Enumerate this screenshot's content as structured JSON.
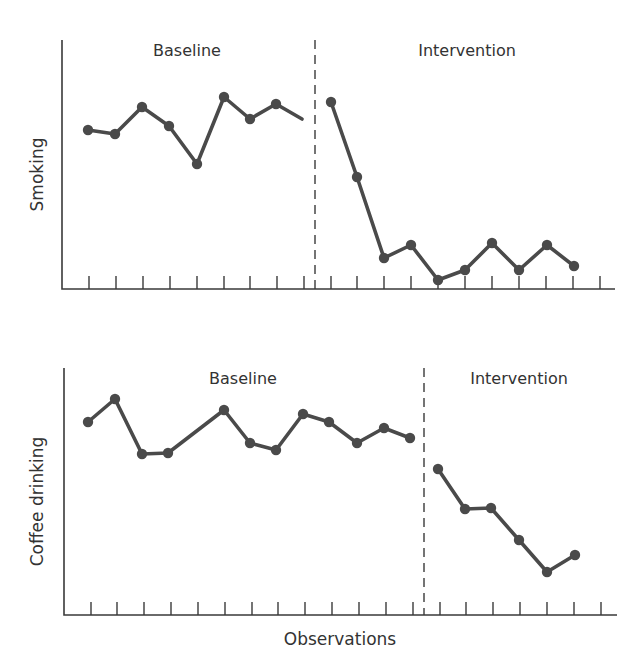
{
  "chart_data": [
    {
      "type": "line",
      "title": "",
      "ylabel": "Smoking",
      "xlabel": "",
      "grid": false,
      "phases": [
        {
          "label": "Baseline",
          "start_obs": 1,
          "end_obs": 9
        },
        {
          "label": "Intervention",
          "start_obs": 10,
          "end_obs": 19
        }
      ],
      "phase_change_after_obs": 9,
      "observations": 20,
      "y_units": "relative (0 = axis, 100 = top)",
      "series": [
        {
          "name": "Baseline",
          "x": [
            1,
            2,
            3,
            4,
            5,
            6,
            7,
            8,
            9
          ],
          "values": [
            63,
            62,
            73,
            65,
            51,
            77,
            68,
            74,
            68
          ],
          "last_point_marker": false
        },
        {
          "name": "Intervention",
          "x": [
            10,
            11,
            12,
            13,
            14,
            15,
            16,
            17,
            18,
            19
          ],
          "values": [
            75,
            45,
            13,
            18,
            4,
            8,
            19,
            8,
            18,
            10
          ]
        }
      ]
    },
    {
      "type": "line",
      "title": "",
      "ylabel": "Coffee drinking",
      "xlabel": "Observations",
      "grid": false,
      "phases": [
        {
          "label": "Baseline",
          "start_obs": 1,
          "end_obs": 13
        },
        {
          "label": "Intervention",
          "start_obs": 14,
          "end_obs": 19
        }
      ],
      "phase_change_after_obs": 13,
      "observations": 20,
      "y_units": "relative (0 = axis, 100 = top)",
      "series": [
        {
          "name": "Baseline",
          "x": [
            1,
            2,
            4,
            5,
            7,
            8,
            9,
            10,
            11,
            12,
            13,
            14
          ],
          "values": [
            78,
            88,
            65,
            66,
            84,
            70,
            67,
            82,
            78,
            70,
            76,
            72
          ]
        },
        {
          "name": "Intervention",
          "x": [
            15,
            16,
            17,
            18,
            19,
            20
          ],
          "values": [
            59,
            43,
            43,
            30,
            17,
            24
          ]
        }
      ]
    }
  ],
  "panels": [
    {
      "ylabel": "Smoking",
      "phase_labels": [
        "Baseline",
        "Intervention"
      ],
      "frame": {
        "x0": 62,
        "y_top": 40,
        "y_axis": 289,
        "x_end": 615
      },
      "ticks_x": [
        89,
        116,
        143,
        170,
        197,
        224,
        250,
        277,
        304,
        331,
        357,
        384,
        411,
        438,
        465,
        492,
        519,
        546,
        573,
        600
      ],
      "phase_x": 315,
      "phase_label_pos": [
        {
          "x": 187,
          "y": 56
        },
        {
          "x": 467,
          "y": 56
        }
      ],
      "points_px": [
        [
          [
            88,
            130
          ],
          [
            115,
            134
          ],
          [
            142,
            107
          ],
          [
            169,
            126
          ],
          [
            197,
            164
          ],
          [
            224,
            97
          ],
          [
            250,
            119
          ],
          [
            276,
            104
          ],
          [
            302,
            119,
            0
          ]
        ],
        [
          [
            331,
            102
          ],
          [
            357,
            177
          ],
          [
            384,
            258
          ],
          [
            411,
            245
          ],
          [
            438,
            280
          ],
          [
            465,
            270
          ],
          [
            492,
            243
          ],
          [
            519,
            270
          ],
          [
            547,
            245
          ],
          [
            574,
            266
          ]
        ]
      ]
    },
    {
      "ylabel": "Coffee drinking",
      "phase_labels": [
        "Baseline",
        "Intervention"
      ],
      "frame": {
        "x0": 64,
        "y_top": 368,
        "y_axis": 615,
        "x_end": 617
      },
      "ticks_x": [
        91,
        117,
        144,
        171,
        198,
        225,
        252,
        278,
        305,
        332,
        359,
        386,
        413,
        440,
        466,
        493,
        520,
        547,
        574,
        601
      ],
      "phase_x": 424,
      "phase_label_pos": [
        {
          "x": 243,
          "y": 384
        },
        {
          "x": 519,
          "y": 384
        }
      ],
      "points_px": [
        [
          [
            88,
            422
          ],
          [
            115,
            399
          ],
          [
            142,
            454
          ],
          [
            168,
            453
          ],
          [
            224,
            410
          ],
          [
            250,
            443
          ],
          [
            276,
            450
          ],
          [
            303,
            414
          ],
          [
            329,
            422
          ],
          [
            357,
            443
          ],
          [
            384,
            428
          ],
          [
            410,
            438
          ]
        ],
        [
          [
            438,
            469
          ],
          [
            465,
            509
          ],
          [
            491,
            508
          ],
          [
            519,
            540
          ],
          [
            547,
            572
          ],
          [
            575,
            555
          ]
        ]
      ]
    }
  ],
  "xlabel": "Observations",
  "xlabel_pos": {
    "x": 340,
    "y": 645
  }
}
